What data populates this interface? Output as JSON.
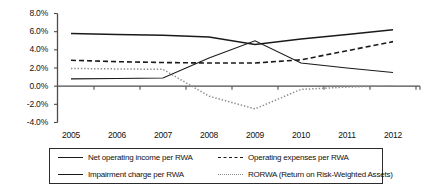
{
  "chart_data": {
    "type": "line",
    "title": "",
    "xlabel": "",
    "ylabel": "",
    "categories": [
      "2005",
      "2006",
      "2007",
      "2008",
      "2009",
      "2010",
      "2011",
      "2012"
    ],
    "x": [
      2005,
      2006,
      2007,
      2008,
      2009,
      2010,
      2011,
      2012
    ],
    "ylim": [
      -4.0,
      8.0
    ],
    "ytick_labels": [
      "8.0%",
      "6.0%",
      "4.0%",
      "2.0%",
      "0.0%",
      "-2.0%",
      "-4.0%"
    ],
    "ytick_values": [
      8.0,
      6.0,
      4.0,
      2.0,
      0.0,
      -2.0,
      -4.0
    ],
    "y_unit": "%",
    "grid": false,
    "legend_position": "bottom",
    "series": [
      {
        "name": "Net operating income per RWA",
        "style": "solid-thick",
        "color": "#1a1a1a",
        "values": [
          5.8,
          5.7,
          5.6,
          5.4,
          4.6,
          5.2,
          5.7,
          6.2
        ]
      },
      {
        "name": "Operating expenses per RWA",
        "style": "dashed",
        "color": "#1a1a1a",
        "values": [
          2.85,
          2.7,
          2.6,
          2.55,
          2.55,
          2.9,
          3.9,
          4.9
        ]
      },
      {
        "name": "Impairment charge per RWA",
        "style": "solid-thin",
        "color": "#1a1a1a",
        "values": [
          0.8,
          0.85,
          0.9,
          3.1,
          5.0,
          2.55,
          2.0,
          1.5
        ]
      },
      {
        "name": "RORWA (Return on Risk-Weighted Assets)",
        "style": "dotted",
        "color": "#8c8c8c",
        "values": [
          1.95,
          1.9,
          1.85,
          -1.1,
          -2.5,
          -0.35,
          -0.1,
          0.05
        ]
      }
    ]
  },
  "legend": {
    "entries": [
      {
        "label": "Net operating income per RWA",
        "style": "solid-thick"
      },
      {
        "label": "Operating expenses per RWA",
        "style": "dashed"
      },
      {
        "label": "Impairment charge per RWA",
        "style": "solid-thin"
      },
      {
        "label": "RORWA (Return on Risk-Weighted Assets)",
        "style": "dotted"
      }
    ]
  },
  "axis_colors": {
    "axis_line": "#4d4d4d",
    "text": "#111111",
    "dotted_series": "#8c8c8c"
  }
}
